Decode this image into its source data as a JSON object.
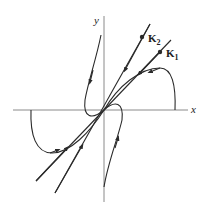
{
  "diagram": {
    "type": "phase-portrait",
    "axes": {
      "x_label": "x",
      "y_label": "y"
    },
    "eigenvectors": [
      {
        "name": "K",
        "subscript": "2"
      },
      {
        "name": "K",
        "subscript": "1"
      }
    ],
    "colors": {
      "axis": "#8a8a8a",
      "curve": "#2a2a2a",
      "background": "#ffffff"
    }
  }
}
